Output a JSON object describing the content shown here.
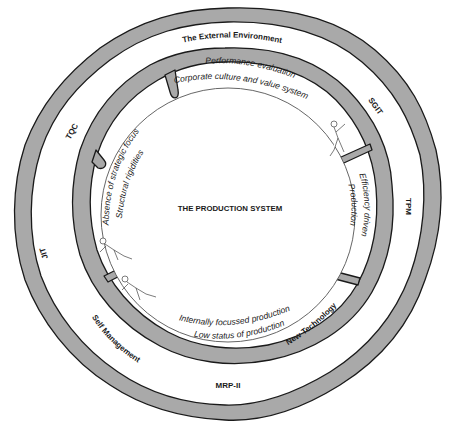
{
  "diagram": {
    "center_label": "THE PRODUCTION SYSTEM",
    "outer_ring": {
      "title": "The External Environment",
      "labels": [
        "SGIT",
        "TPM",
        "New Technology",
        "MRP-II",
        "Self Management",
        "JIT",
        "TQC"
      ]
    },
    "inner_ring": {
      "segments": [
        {
          "id": "top",
          "lines": [
            "Performance evaluation",
            "Corporate culture and value system"
          ]
        },
        {
          "id": "right",
          "lines": [
            "Efficiency driven",
            "Production"
          ]
        },
        {
          "id": "bottom",
          "lines": [
            "Internally focussed production",
            "Low status of production"
          ]
        },
        {
          "id": "left",
          "lines": [
            "Absence of strategic focus",
            "Structural rigidities"
          ]
        }
      ]
    },
    "figures": [
      "climber-top-right",
      "climber-left-upper",
      "climber-left-lower"
    ],
    "colors": {
      "wall_fill": "#a9a9a9",
      "wall_stroke": "#1a1a1a",
      "background": "#ffffff"
    }
  }
}
